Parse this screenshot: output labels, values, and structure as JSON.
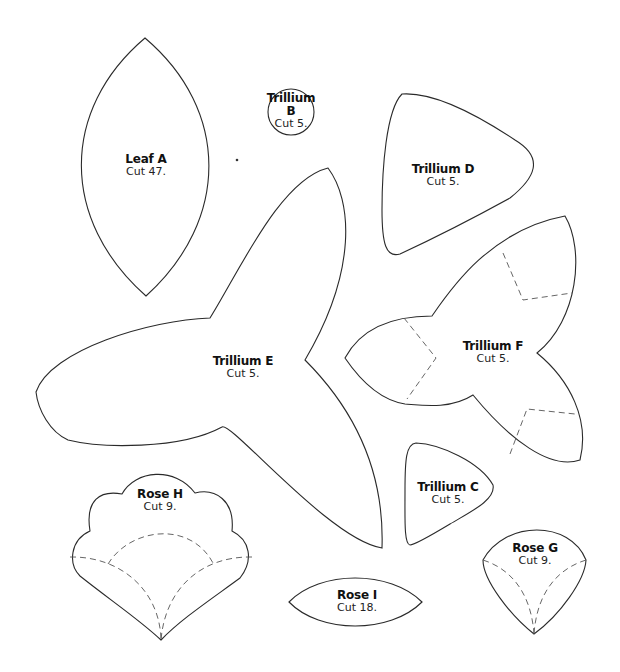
{
  "sheet": {
    "pieces": [
      {
        "id": "leaf-a",
        "name": "Leaf A",
        "cut": "Cut 47."
      },
      {
        "id": "trillium-b",
        "name": "Trillium B",
        "name_line1": "Trillium",
        "name_line2": "B",
        "cut": "Cut 5."
      },
      {
        "id": "trillium-d",
        "name": "Trillium D",
        "cut": "Cut 5."
      },
      {
        "id": "trillium-e",
        "name": "Trillium E",
        "cut": "Cut 5."
      },
      {
        "id": "trillium-f",
        "name": "Trillium F",
        "cut": "Cut 5."
      },
      {
        "id": "trillium-c",
        "name": "Trillium C",
        "cut": "Cut 5."
      },
      {
        "id": "rose-h",
        "name": "Rose H",
        "cut": "Cut 9."
      },
      {
        "id": "rose-i",
        "name": "Rose I",
        "cut": "Cut 18."
      },
      {
        "id": "rose-g",
        "name": "Rose G",
        "cut": "Cut 9."
      }
    ]
  },
  "colors": {
    "outline": "#2a2a2a",
    "dashed_guide": "#555555",
    "background": "#ffffff"
  }
}
